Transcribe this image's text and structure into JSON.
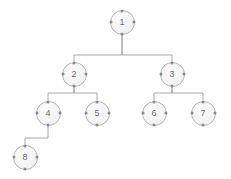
{
  "diagram": {
    "background_color": "#ffffff",
    "node_fill_color": "#f2f2f2",
    "node_border_color": "#b9b9b9",
    "handle_color": "#8a8a8a",
    "edge_color": "#a8a8a8",
    "label_color": "#6d6d6d",
    "node_diameter": 25,
    "nodes": [
      {
        "id": "1",
        "label": "1",
        "cx": 122,
        "cy": 22,
        "r": 12.5,
        "level": 0
      },
      {
        "id": "2",
        "label": "2",
        "cx": 74,
        "cy": 74,
        "r": 12.5,
        "level": 1
      },
      {
        "id": "3",
        "label": "3",
        "cx": 172,
        "cy": 74,
        "r": 12.5,
        "level": 1
      },
      {
        "id": "4",
        "label": "4",
        "cx": 48,
        "cy": 113,
        "r": 12.5,
        "level": 2
      },
      {
        "id": "5",
        "label": "5",
        "cx": 97,
        "cy": 113,
        "r": 12.5,
        "level": 2
      },
      {
        "id": "6",
        "label": "6",
        "cx": 154,
        "cy": 113,
        "r": 12.5,
        "level": 2
      },
      {
        "id": "7",
        "label": "7",
        "cx": 203,
        "cy": 113,
        "r": 12.5,
        "level": 2
      },
      {
        "id": "8",
        "label": "8",
        "cx": 25,
        "cy": 157,
        "r": 12.5,
        "level": 3
      }
    ],
    "edges": [
      {
        "from": "1",
        "to": "2",
        "path": "M 122 34.5 L 122 55 L 74 55 L 74 61.5"
      },
      {
        "from": "1",
        "to": "3",
        "path": "M 122 34.5 L 122 55 L 172 55 L 172 61.5"
      },
      {
        "from": "2",
        "to": "4",
        "path": "M 74 86.5 L 74 93 L 48 93 L 48 100.5"
      },
      {
        "from": "2",
        "to": "5",
        "path": "M 74 86.5 L 74 93 L 97 93 L 97 100.5"
      },
      {
        "from": "3",
        "to": "6",
        "path": "M 172 86.5 L 172 93 L 154 93 L 154 100.5"
      },
      {
        "from": "3",
        "to": "7",
        "path": "M 172 86.5 L 172 93 L 203 93 L 203 100.5"
      },
      {
        "from": "4",
        "to": "8",
        "path": "M 48 125.5 L 48 138 L 25 138 L 25 144.5"
      }
    ],
    "handles": [
      "n",
      "s",
      "e",
      "w"
    ]
  }
}
